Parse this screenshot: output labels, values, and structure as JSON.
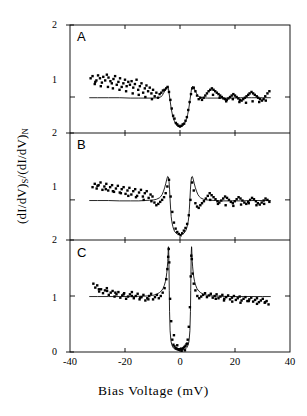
{
  "figure": {
    "axis_title_x": "Bias Voltage (mV)",
    "axis_title_y_main": "(dI/dV)",
    "axis_title_y_sub1": "S",
    "axis_title_y_mid": "/(dI/dV)",
    "axis_title_y_sub2": "N",
    "line_color": "#000000",
    "marker_color": "#000000",
    "background": "#ffffff"
  },
  "chart_data": [
    {
      "type": "scatter",
      "panel": "A",
      "title": "",
      "xlabel": "Bias Voltage (mV)",
      "ylabel": "(dI/dV)S/(dI/dV)N",
      "xlim": [
        -40,
        40
      ],
      "ylim": [
        0.5,
        2
      ],
      "xticks": [
        -40,
        -20,
        0,
        20,
        40
      ],
      "yticks": [
        1,
        2
      ],
      "ytick_labels": [
        "1",
        "2"
      ],
      "grid": false,
      "legend": "none",
      "fit_curve": {
        "name": "broadened BCS fit",
        "x": [
          -33,
          -30,
          -26,
          -22,
          -18,
          -15,
          -12,
          -10,
          -8,
          -7,
          -6.5,
          -6,
          -5.5,
          -5,
          -4.6,
          -4.2,
          -4,
          -3.6,
          -3.2,
          -2.8,
          -2.4,
          -2,
          -1.5,
          -1,
          -0.5,
          0,
          0.5,
          1,
          1.5,
          2,
          2.4,
          2.8,
          3.2,
          3.6,
          4,
          4.2,
          4.6,
          5,
          5.5,
          6,
          6.5,
          7,
          8,
          10,
          12,
          15,
          18,
          22,
          26,
          30,
          33
        ],
        "y": [
          0.99,
          0.99,
          0.99,
          0.99,
          0.985,
          0.985,
          0.985,
          0.985,
          0.99,
          1.0,
          1.02,
          1.05,
          1.09,
          1.13,
          1.15,
          1.12,
          1.06,
          0.95,
          0.84,
          0.76,
          0.7,
          0.66,
          0.62,
          0.6,
          0.59,
          0.585,
          0.59,
          0.6,
          0.62,
          0.66,
          0.7,
          0.76,
          0.84,
          0.95,
          1.06,
          1.12,
          1.15,
          1.13,
          1.09,
          1.05,
          1.02,
          1.0,
          0.99,
          0.985,
          0.985,
          0.985,
          0.985,
          0.99,
          0.99,
          0.99,
          0.99
        ]
      },
      "points": {
        "x": [
          -32.5,
          -31.8,
          -31.0,
          -30.4,
          -29.8,
          -29.1,
          -28.4,
          -27.9,
          -27.2,
          -26.6,
          -26.0,
          -25.3,
          -24.8,
          -24.2,
          -23.6,
          -23.0,
          -22.4,
          -21.8,
          -21.2,
          -20.6,
          -20.0,
          -19.4,
          -18.8,
          -18.2,
          -17.6,
          -17.0,
          -16.4,
          -15.8,
          -15.2,
          -14.6,
          -14.0,
          -13.4,
          -12.8,
          -12.2,
          -11.6,
          -11.0,
          -10.4,
          -9.8,
          -9.2,
          -8.6,
          -8.0,
          -7.4,
          -6.8,
          -6.2,
          -5.6,
          -5.0,
          -4.5,
          -4.0,
          -3.5,
          -3.0,
          -2.5,
          -2.0,
          -1.5,
          -1.0,
          -0.5,
          0.0,
          0.5,
          1.0,
          1.5,
          2.0,
          2.5,
          3.0,
          3.5,
          4.0,
          4.5,
          5.0,
          5.6,
          6.2,
          6.8,
          7.4,
          8.0,
          8.6,
          9.2,
          9.8,
          10.4,
          11.0,
          11.6,
          12.2,
          12.8,
          13.4,
          14.0,
          14.6,
          15.2,
          15.8,
          16.4,
          17.0,
          17.6,
          18.2,
          18.8,
          19.4,
          20.0,
          20.6,
          21.2,
          21.8,
          22.4,
          23.0,
          23.6,
          24.2,
          24.8,
          25.3,
          26.0,
          26.6,
          27.2,
          27.9,
          28.4,
          29.1,
          29.8,
          30.4,
          31.0,
          31.8,
          32.5,
          -30.8,
          -28.8,
          -26.2,
          -24.4,
          -22.0,
          -19.6,
          -17.2,
          -15.0,
          -12.6,
          -10.2,
          12.0,
          14.4,
          16.8,
          19.2,
          21.6,
          24.0,
          26.4,
          28.8,
          31.2
        ],
        "y": [
          1.26,
          1.29,
          1.18,
          1.23,
          1.3,
          1.26,
          1.2,
          1.28,
          1.23,
          1.31,
          1.27,
          1.22,
          1.19,
          1.25,
          1.29,
          1.17,
          1.21,
          1.26,
          1.14,
          1.19,
          1.24,
          1.15,
          1.21,
          1.17,
          1.22,
          1.13,
          1.18,
          1.24,
          1.1,
          1.15,
          1.19,
          1.06,
          1.12,
          1.16,
          1.08,
          1.13,
          1.05,
          1.1,
          1.01,
          1.06,
          0.99,
          1.04,
          1.06,
          1.09,
          1.1,
          1.12,
          1.14,
          1.07,
          0.96,
          0.84,
          0.74,
          0.7,
          0.64,
          0.62,
          0.6,
          0.59,
          0.6,
          0.62,
          0.63,
          0.67,
          0.72,
          0.82,
          0.93,
          1.04,
          1.12,
          1.13,
          1.08,
          1.02,
          0.97,
          0.99,
          0.96,
          0.99,
          1.02,
          1.05,
          1.08,
          1.1,
          1.12,
          1.1,
          1.08,
          1.06,
          1.04,
          1.02,
          1.0,
          0.98,
          0.97,
          0.96,
          0.98,
          1.0,
          1.02,
          1.04,
          1.02,
          1.0,
          0.98,
          0.96,
          0.95,
          0.97,
          0.99,
          1.01,
          1.03,
          1.05,
          1.07,
          1.05,
          1.03,
          1.01,
          0.99,
          0.97,
          0.95,
          0.97,
          1.01,
          1.05,
          1.08,
          1.21,
          1.15,
          1.14,
          1.12,
          1.1,
          1.08,
          1.05,
          1.03,
          1.0,
          0.97,
          1.03,
          0.99,
          0.94,
          0.97,
          0.93,
          0.92,
          0.94,
          0.93,
          0.95
        ]
      }
    },
    {
      "type": "scatter",
      "panel": "B",
      "xlim": [
        -40,
        40
      ],
      "ylim": [
        0.4,
        2
      ],
      "xticks": [
        -40,
        -20,
        0,
        20,
        40
      ],
      "yticks": [
        1,
        2
      ],
      "ytick_labels": [
        "1",
        "2"
      ],
      "grid": false,
      "fit_curve": {
        "name": "broadened BCS fit",
        "x": [
          -33,
          -30,
          -26,
          -22,
          -18,
          -15,
          -13,
          -11,
          -9.5,
          -8.5,
          -7.5,
          -7,
          -6.5,
          -6,
          -5.6,
          -5.2,
          -4.8,
          -4.5,
          -4.2,
          -4.0,
          -3.8,
          -3.6,
          -3.4,
          -3.2,
          -3.0,
          -2.6,
          -2.2,
          -1.8,
          -1.4,
          -1.0,
          -0.5,
          0,
          0.5,
          1.0,
          1.4,
          1.8,
          2.2,
          2.6,
          3.0,
          3.2,
          3.4,
          3.6,
          3.8,
          4.0,
          4.2,
          4.5,
          4.8,
          5.2,
          5.6,
          6,
          6.5,
          7,
          7.5,
          8.5,
          9.5,
          11,
          13,
          15,
          18,
          22,
          26,
          30,
          33
        ],
        "y": [
          0.99,
          0.99,
          0.99,
          0.985,
          0.985,
          0.985,
          0.99,
          0.995,
          1.0,
          1.01,
          1.03,
          1.05,
          1.08,
          1.13,
          1.18,
          1.24,
          1.31,
          1.35,
          1.34,
          1.28,
          1.16,
          1.0,
          0.86,
          0.75,
          0.68,
          0.6,
          0.55,
          0.52,
          0.5,
          0.49,
          0.485,
          0.48,
          0.485,
          0.49,
          0.5,
          0.52,
          0.55,
          0.6,
          0.68,
          0.75,
          0.86,
          1.0,
          1.16,
          1.28,
          1.34,
          1.35,
          1.31,
          1.24,
          1.18,
          1.13,
          1.08,
          1.05,
          1.03,
          1.01,
          1.0,
          0.995,
          0.99,
          0.985,
          0.985,
          0.985,
          0.99,
          0.99,
          0.99
        ]
      },
      "points": {
        "x": [
          -31.8,
          -31.0,
          -30.3,
          -29.6,
          -28.9,
          -28.2,
          -27.5,
          -26.8,
          -26.1,
          -25.4,
          -24.7,
          -24.0,
          -23.3,
          -22.6,
          -21.9,
          -21.2,
          -20.5,
          -19.8,
          -19.1,
          -18.4,
          -17.7,
          -17.0,
          -16.3,
          -15.6,
          -14.9,
          -14.2,
          -13.5,
          -12.8,
          -12.1,
          -11.4,
          -10.7,
          -10.0,
          -9.3,
          -8.6,
          -7.9,
          -7.2,
          -6.5,
          -5.8,
          -5.2,
          -4.6,
          -4.0,
          -3.4,
          -2.8,
          -2.2,
          -1.6,
          -1.0,
          -0.4,
          0.2,
          0.8,
          1.4,
          2.0,
          2.6,
          3.2,
          3.8,
          4.4,
          5.0,
          5.6,
          6.2,
          6.8,
          7.4,
          8.0,
          8.7,
          9.4,
          10.1,
          10.8,
          11.5,
          12.2,
          12.9,
          13.6,
          14.3,
          15.0,
          15.7,
          16.4,
          17.1,
          17.8,
          18.5,
          19.2,
          19.9,
          20.6,
          21.3,
          22.0,
          22.7,
          23.4,
          24.1,
          24.8,
          25.5,
          26.2,
          26.9,
          27.6,
          28.3,
          29.0,
          29.7,
          30.4,
          31.1,
          31.8,
          32.5,
          -30.0,
          -27.0,
          -24.4,
          -21.5,
          -18.8,
          -16.0,
          -13.2,
          -10.4,
          11.0,
          13.8,
          16.6,
          19.4,
          22.2,
          25.0,
          27.8,
          30.6
        ],
        "y": [
          1.19,
          1.24,
          1.17,
          1.22,
          1.26,
          1.15,
          1.2,
          1.24,
          1.14,
          1.19,
          1.22,
          1.12,
          1.17,
          1.21,
          1.11,
          1.16,
          1.19,
          1.09,
          1.14,
          1.18,
          1.08,
          1.13,
          1.16,
          1.06,
          1.11,
          1.15,
          1.05,
          1.1,
          1.13,
          1.03,
          1.08,
          1.05,
          0.96,
          0.92,
          0.94,
          0.97,
          1.0,
          1.04,
          1.1,
          1.2,
          1.3,
          1.05,
          0.82,
          0.66,
          0.57,
          0.52,
          0.49,
          0.47,
          0.5,
          0.54,
          0.58,
          0.64,
          0.77,
          1.0,
          1.26,
          1.14,
          0.95,
          0.9,
          0.88,
          0.92,
          0.95,
          0.98,
          1.02,
          1.06,
          1.1,
          1.07,
          1.04,
          1.01,
          0.98,
          0.96,
          0.99,
          1.02,
          1.05,
          1.03,
          1.0,
          0.97,
          0.95,
          0.98,
          1.01,
          1.04,
          1.02,
          0.99,
          0.96,
          0.94,
          0.97,
          1.0,
          1.03,
          1.01,
          0.98,
          0.95,
          0.93,
          0.96,
          0.99,
          1.02,
          1.0,
          0.97,
          1.21,
          1.16,
          1.13,
          1.1,
          1.06,
          1.04,
          1.0,
          0.98,
          1.0,
          0.94,
          0.92,
          0.91,
          0.93,
          0.95,
          0.92,
          0.94
        ]
      }
    },
    {
      "type": "scatter",
      "panel": "C",
      "xlim": [
        -40,
        40
      ],
      "ylim": [
        0,
        2
      ],
      "xticks": [
        -40,
        -20,
        0,
        20,
        40
      ],
      "yticks": [
        0,
        1,
        2
      ],
      "ytick_labels": [
        "0",
        "1",
        "2"
      ],
      "grid": false,
      "fit_curve": {
        "name": "BCS fit",
        "x": [
          -33,
          -30,
          -26,
          -22,
          -18,
          -15,
          -12,
          -10,
          -8.5,
          -7.5,
          -6.8,
          -6.2,
          -5.7,
          -5.3,
          -5.0,
          -4.8,
          -4.6,
          -4.45,
          -4.35,
          -4.3,
          -4.25,
          -4.2,
          -4.1,
          -4.0,
          -3.9,
          -3.8,
          -3.6,
          -3.3,
          -3.0,
          -2.5,
          -2.0,
          -1.2,
          -0.5,
          0,
          0.5,
          1.2,
          2.0,
          2.5,
          3.0,
          3.3,
          3.6,
          3.8,
          3.9,
          4.0,
          4.1,
          4.2,
          4.25,
          4.3,
          4.35,
          4.45,
          4.6,
          4.8,
          5.0,
          5.3,
          5.7,
          6.2,
          6.8,
          7.5,
          8.5,
          10,
          12,
          15,
          18,
          22,
          26,
          30,
          33
        ],
        "y": [
          0.99,
          0.99,
          0.99,
          0.99,
          0.99,
          0.995,
          1.0,
          1.01,
          1.03,
          1.06,
          1.09,
          1.13,
          1.19,
          1.26,
          1.34,
          1.42,
          1.52,
          1.62,
          1.72,
          1.8,
          1.86,
          1.88,
          1.78,
          1.5,
          1.1,
          0.72,
          0.38,
          0.2,
          0.13,
          0.08,
          0.055,
          0.04,
          0.035,
          0.033,
          0.035,
          0.04,
          0.055,
          0.08,
          0.13,
          0.2,
          0.38,
          0.72,
          1.1,
          1.5,
          1.78,
          1.88,
          1.86,
          1.8,
          1.72,
          1.62,
          1.52,
          1.42,
          1.34,
          1.26,
          1.19,
          1.13,
          1.09,
          1.06,
          1.03,
          1.01,
          1.0,
          0.995,
          0.99,
          0.99,
          0.99,
          0.99,
          0.99
        ]
      },
      "points": {
        "x": [
          -31.5,
          -30.8,
          -30.1,
          -29.4,
          -28.7,
          -28.0,
          -27.3,
          -26.6,
          -25.9,
          -25.2,
          -24.5,
          -23.8,
          -23.1,
          -22.4,
          -21.7,
          -21.0,
          -20.3,
          -19.6,
          -18.9,
          -18.2,
          -17.5,
          -16.8,
          -16.1,
          -15.4,
          -14.7,
          -14.0,
          -13.3,
          -12.6,
          -11.9,
          -11.2,
          -10.5,
          -9.8,
          -9.1,
          -8.4,
          -7.7,
          -7.0,
          -6.3,
          -5.6,
          -5.0,
          -4.6,
          -4.3,
          -4.1,
          -3.9,
          -3.6,
          -3.2,
          -2.8,
          -2.4,
          -2.0,
          -1.6,
          -1.2,
          -0.8,
          -0.4,
          0.0,
          0.4,
          0.8,
          1.2,
          1.6,
          2.0,
          2.4,
          2.8,
          3.2,
          3.6,
          3.9,
          4.1,
          4.3,
          4.6,
          5.0,
          5.6,
          6.3,
          7.0,
          7.7,
          8.4,
          9.1,
          9.8,
          10.5,
          11.2,
          11.9,
          12.6,
          13.3,
          14.0,
          14.7,
          15.4,
          16.1,
          16.8,
          17.5,
          18.2,
          18.9,
          19.6,
          20.3,
          21.0,
          21.7,
          22.4,
          23.1,
          23.8,
          24.5,
          25.2,
          25.9,
          26.6,
          27.3,
          28.0,
          28.7,
          29.4,
          30.1,
          30.8,
          31.5,
          32.2,
          -29.5,
          -26.5,
          -23.5,
          -20.5,
          -17.5,
          -14.5,
          -11.5,
          13.0,
          16.0,
          19.0,
          22.0,
          25.0,
          28.0,
          31.0,
          -1.0,
          0.6,
          1.8,
          -2.2,
          2.6
        ],
        "y": [
          1.22,
          1.15,
          1.19,
          1.08,
          1.12,
          1.05,
          1.1,
          1.14,
          1.02,
          1.06,
          1.09,
          0.99,
          1.03,
          1.07,
          0.97,
          1.01,
          1.05,
          0.95,
          0.99,
          1.03,
          1.07,
          0.96,
          1.0,
          1.04,
          0.94,
          0.98,
          1.02,
          0.92,
          0.96,
          1.0,
          1.04,
          0.94,
          0.98,
          1.02,
          0.96,
          1.0,
          1.06,
          1.14,
          1.3,
          1.48,
          1.7,
          1.84,
          1.6,
          0.95,
          0.55,
          0.22,
          0.13,
          0.1,
          0.07,
          0.06,
          0.05,
          0.04,
          0.05,
          0.06,
          0.05,
          0.07,
          0.09,
          0.11,
          0.14,
          0.22,
          0.45,
          0.8,
          1.35,
          1.72,
          1.66,
          1.4,
          1.22,
          1.1,
          1.0,
          0.96,
          0.99,
          1.02,
          1.05,
          0.98,
          1.01,
          1.04,
          0.97,
          1.0,
          1.03,
          0.96,
          0.99,
          1.02,
          0.95,
          0.98,
          1.01,
          0.94,
          0.97,
          1.0,
          0.93,
          0.96,
          0.99,
          0.92,
          0.95,
          0.98,
          0.91,
          0.94,
          0.97,
          0.9,
          0.93,
          0.96,
          0.89,
          0.92,
          0.95,
          0.88,
          0.91,
          0.85,
          1.12,
          1.09,
          1.06,
          1.03,
          1.0,
          0.97,
          0.94,
          0.95,
          0.92,
          0.9,
          0.88,
          0.91,
          0.86,
          0.89,
          0.12,
          0.02,
          0.03,
          0.3,
          0.15
        ]
      }
    }
  ],
  "panels": [
    {
      "letter": "A",
      "ytop_label": "2",
      "ymid_label": "1"
    },
    {
      "letter": "B",
      "ytop_label": "2",
      "ymid_label": "1"
    },
    {
      "letter": "C",
      "ytop_label": "2",
      "ymid_label": "1",
      "ybot_label": "0"
    }
  ],
  "xticklabels": [
    "-40",
    "-20",
    "0",
    "20",
    "40"
  ]
}
